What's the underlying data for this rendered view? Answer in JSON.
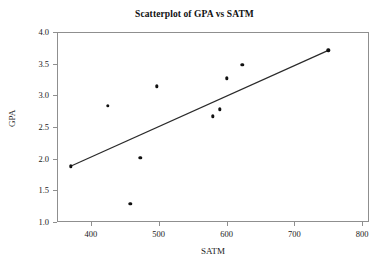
{
  "chart_data": {
    "type": "scatter",
    "title": "Scatterplot of GPA vs SATM",
    "xlabel": "SATM",
    "ylabel": "GPA",
    "xlim": [
      350,
      810
    ],
    "ylim": [
      1.0,
      4.0
    ],
    "grid": false,
    "legend": null,
    "x_ticks": [
      400,
      500,
      600,
      700,
      800
    ],
    "x_tick_labels": [
      "400",
      "500",
      "600",
      "700",
      "800"
    ],
    "y_ticks": [
      1.0,
      1.5,
      2.0,
      2.5,
      3.0,
      3.5,
      4.0
    ],
    "y_tick_labels": [
      "1.0",
      "1.5",
      "2.0",
      "2.5",
      "3.0",
      "3.5",
      "4.0"
    ],
    "marker_color": "#111111",
    "line_color": "#2a2a2a",
    "frame_color": "#8f8f8f",
    "background": "#ffffff",
    "series": [
      {
        "name": "GPA vs SATM",
        "marker": "filled-circle",
        "x": [
          370,
          425,
          458,
          473,
          497,
          580,
          590,
          600,
          623,
          750
        ],
        "y": [
          1.88,
          2.83,
          1.29,
          2.01,
          3.14,
          2.67,
          2.78,
          3.27,
          3.48,
          3.71
        ]
      }
    ],
    "trend_line": {
      "name": "fitted regression line",
      "x_start": 370,
      "y_start": 1.88,
      "x_end": 750,
      "y_end": 3.71
    }
  }
}
